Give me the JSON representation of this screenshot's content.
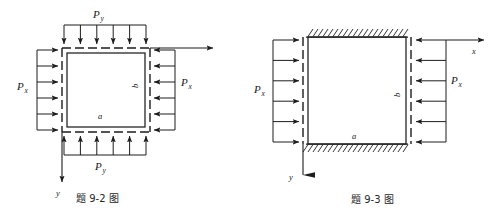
{
  "figure": {
    "title_hidden": "",
    "background_color": "#ffffff",
    "ink_color": "#1d1d1d"
  },
  "left_figure": {
    "name": "题 9-2 图",
    "caption": "题 9-2 图",
    "description": "Square plate with all four edges free, loaded by uniform in-plane pressures Px on vertical edges and Py on horizontal edges",
    "labels": {
      "load_top": "P",
      "load_top_sub": "y",
      "load_bottom": "P",
      "load_bottom_sub": "y",
      "load_left": "P",
      "load_left_sub": "x",
      "load_right": "P",
      "load_right_sub": "x",
      "dim_bottom": "a",
      "dim_right": "b",
      "axis_x": "x",
      "axis_y": "y"
    },
    "arrow_counts": {
      "top": 6,
      "bottom": 6,
      "left": 6,
      "right": 6
    }
  },
  "right_figure": {
    "name": "题 9-3 图",
    "caption": "题 9-3 图",
    "description": "Rectangular plate with top and bottom edges clamped (hatched) and left/right edges loaded by uniform pressure Px",
    "labels": {
      "load_left": "P",
      "load_left_sub": "x",
      "load_right": "P",
      "load_right_sub": "x",
      "dim_bottom": "a",
      "dim_right": "b",
      "axis_x": "x",
      "axis_y": "y"
    },
    "arrow_counts": {
      "left": 6,
      "right": 6
    },
    "edge_conditions": {
      "top": "clamped-hatched",
      "bottom": "clamped-hatched",
      "left": "free-loaded",
      "right": "free-loaded"
    }
  }
}
